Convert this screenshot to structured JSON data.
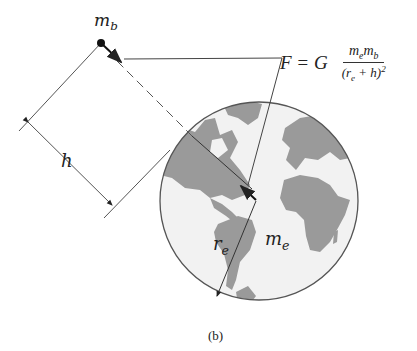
{
  "figure": {
    "caption": "(b)",
    "labels": {
      "satellite_mass": "m",
      "satellite_mass_sub": "b",
      "earth_mass": "m",
      "earth_mass_sub": "e",
      "earth_radius": "r",
      "earth_radius_sub": "e",
      "height": "h"
    },
    "formula": {
      "lhs": "F = G",
      "numerator": "m",
      "numerator_sub1": "e",
      "numerator_m2": "m",
      "numerator_sub2": "b",
      "denominator_open": "(r",
      "denominator_sub": "e",
      "denominator_rest": " + h)",
      "denominator_exp": "2"
    },
    "colors": {
      "land": "#9a9a9a",
      "ocean": "#f2f2f2",
      "line": "#444444",
      "outline": "#555555"
    }
  }
}
